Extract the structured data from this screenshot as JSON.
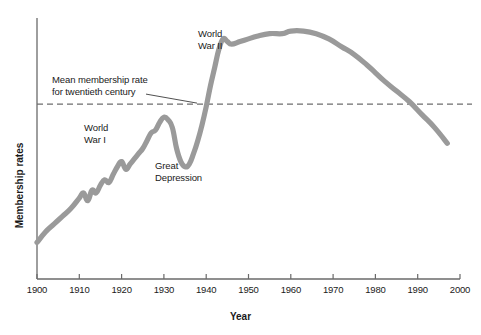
{
  "chart_data": {
    "type": "line",
    "title": "",
    "subtitle": "",
    "xlabel": "Year",
    "ylabel": "Membership rates",
    "xlim": [
      1900,
      2000
    ],
    "ylim": [
      0,
      100
    ],
    "grid": false,
    "legend": "none",
    "xticks": [
      "1900",
      "1910",
      "1920",
      "1930",
      "1940",
      "1950",
      "1960",
      "1970",
      "1980",
      "1990",
      "2000"
    ],
    "xtick_values": [
      1900,
      1910,
      1920,
      1930,
      1940,
      1950,
      1960,
      1970,
      1980,
      1990,
      2000
    ],
    "ytick_labels": [
      "0"
    ],
    "series": [
      {
        "name": "Membership rate",
        "color": "#9a9a9a",
        "x": [
          1900,
          1902,
          1904,
          1906,
          1908,
          1910,
          1911,
          1912,
          1913,
          1914,
          1915,
          1916,
          1917,
          1918,
          1919,
          1920,
          1921,
          1922,
          1923,
          1924,
          1925,
          1926,
          1927,
          1928,
          1929,
          1930,
          1931,
          1932,
          1933,
          1934,
          1935,
          1936,
          1937,
          1938,
          1939,
          1940,
          1941,
          1942,
          1943,
          1944,
          1945,
          1946,
          1948,
          1950,
          1952,
          1955,
          1958,
          1960,
          1963,
          1966,
          1969,
          1972,
          1975,
          1978,
          1980,
          1982,
          1985,
          1988,
          1991,
          1994,
          1997
        ],
        "y": [
          14,
          18,
          21,
          24,
          27,
          31,
          33,
          30,
          34,
          33,
          36,
          38,
          37,
          40,
          43,
          45,
          42,
          44,
          46,
          48,
          50,
          53,
          56,
          57,
          60,
          62,
          61,
          58,
          50,
          45,
          43,
          44,
          48,
          53,
          59,
          66,
          74,
          81,
          88,
          92,
          91,
          90,
          91,
          92,
          93,
          94,
          94,
          95,
          95,
          94,
          92,
          89,
          86,
          82,
          79,
          76,
          72,
          68,
          63,
          58,
          52
        ]
      }
    ],
    "reference_line": {
      "label": "Mean membership rate for twentieth century",
      "y": 67,
      "style": "dashed",
      "color": "#6e6e6e"
    },
    "annotations": [
      {
        "id": "ww2",
        "text": "World\nWar II",
        "x": 1938,
        "y": 95
      },
      {
        "id": "mean",
        "text": "Mean membership rate\nfor twentieth century",
        "x": 1904,
        "y": 80
      },
      {
        "id": "ww1",
        "text": "World\nWar I",
        "x": 1912,
        "y": 58
      },
      {
        "id": "gd",
        "text": "Great\nDepression",
        "x": 1929,
        "y": 38
      }
    ],
    "axis_color": "#555555",
    "background": "#ffffff"
  },
  "axes": {
    "y_top_label": "0",
    "ylabel": "Membership rates",
    "xlabel": "Year"
  }
}
